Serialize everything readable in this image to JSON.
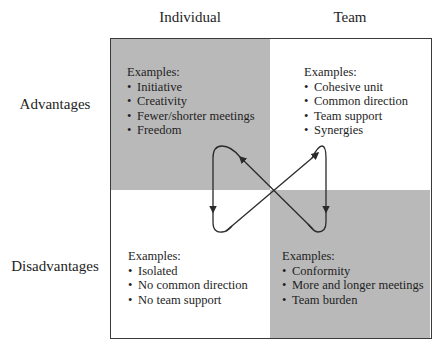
{
  "columns": {
    "individual": "Individual",
    "team": "Team"
  },
  "rows": {
    "advantages": "Advantages",
    "disadvantages": "Disadvantages"
  },
  "quadrants": {
    "individual_advantages": {
      "title": "Examples:",
      "items": [
        "Initiative",
        "Creativity",
        "Fewer/shorter meetings",
        "Freedom"
      ],
      "shaded": true
    },
    "team_advantages": {
      "title": "Examples:",
      "items": [
        "Cohesive unit",
        "Common direction",
        "Team support",
        "Synergies"
      ],
      "shaded": false
    },
    "individual_disadvantages": {
      "title": "Examples:",
      "items": [
        "Isolated",
        "No common direction",
        "No team support"
      ],
      "shaded": false
    },
    "team_disadvantages": {
      "title": "Examples:",
      "items": [
        "Conformity",
        "More and longer meetings",
        "Team burden"
      ],
      "shaded": true
    }
  },
  "colors": {
    "shade": "#b9b9b9",
    "border": "#3a3a3a",
    "arrow": "#2a2a2a",
    "text": "#1e1e1e"
  }
}
